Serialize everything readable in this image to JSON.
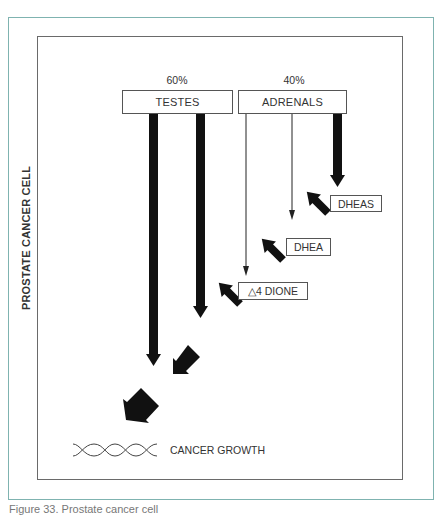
{
  "diagram": {
    "side_label": "PROSTATE CANCER CELL",
    "sources": [
      {
        "name": "TESTES",
        "percent": "60%"
      },
      {
        "name": "ADRENALS",
        "percent": "40%"
      }
    ],
    "hormones": [
      {
        "name": "DHEAS"
      },
      {
        "name": "DHEA"
      },
      {
        "name": "△4 DIONE"
      }
    ],
    "outcome": {
      "label": "CANCER GROWTH",
      "icon": "dna-helix-icon"
    },
    "caption": "Figure 33. Prostate cancer cell"
  },
  "colors": {
    "outer_frame": "#7fb3b0",
    "inner_box": "#6a6a6a",
    "arrow": "#111111",
    "text": "#333333"
  }
}
